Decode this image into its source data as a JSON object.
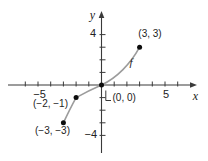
{
  "chart_data": {
    "type": "line",
    "title": "",
    "xlabel": "x",
    "ylabel": "y",
    "curve_label": "f",
    "grid": false,
    "xlim": [
      -7.4,
      7.5
    ],
    "ylim": [
      -5.4,
      5.8
    ],
    "points": [
      {
        "x": 3,
        "y": 3,
        "label": "(3, 3)"
      },
      {
        "x": 0,
        "y": 0,
        "label": "(0, 0)"
      },
      {
        "x": -2,
        "y": -1,
        "label": "(−2, −1)"
      },
      {
        "x": -3,
        "y": -3,
        "label": "(−3, −3)"
      }
    ],
    "x_axis": {
      "ticks_from": -6,
      "ticks_to": 6,
      "labeled_values": [
        -5,
        5
      ],
      "labeled_ticks": [
        "−5",
        "5"
      ]
    },
    "y_axis": {
      "ticks_from": -4,
      "ticks_to": 4,
      "labeled_values": [
        4,
        -4
      ],
      "labeled_ticks": [
        "4",
        "−4"
      ]
    },
    "curve_segments": {
      "start": [
        -3,
        -3
      ],
      "cubics": [
        [
          -2.65,
          -2.25,
          -2.3,
          -1.55,
          -2,
          -1
        ],
        [
          -1.2,
          -0.55,
          -0.5,
          -0.22,
          0,
          0
        ],
        [
          1.2,
          0.55,
          2.3,
          1.7,
          3,
          3
        ]
      ]
    }
  },
  "render": {
    "width": 208,
    "height": 161,
    "background": "#ffffff",
    "axis_color": "#3a3a3a",
    "text_color": "#222222",
    "curve_color": "#9c9c9c",
    "curve_width": 1.6,
    "f_label_color": "#b5b5b5",
    "point_color": "#0d0d0d",
    "point_radius": 2.5,
    "origin": {
      "x": 101.5,
      "y": 85
    },
    "unit": {
      "x": 12.7,
      "y": 12.6
    },
    "x_axis_px": {
      "x1": 8,
      "x2": 191,
      "arrow_tip": 197
    },
    "y_axis_px": {
      "y1": 153,
      "y2": 17,
      "arrow_tip": 11
    },
    "tick": {
      "x_up": 3.5,
      "x_down": 1.5,
      "y_right": 4,
      "y_left": 2
    },
    "origin_leader": [
      [
        105.8,
        90.5
      ],
      [
        105.8,
        100.5
      ],
      [
        111,
        100.5
      ]
    ],
    "labels": {
      "points": [
        {
          "text": "(3, 3)",
          "x": 150,
          "y": 36.5,
          "anchor": "middle",
          "size": 10
        },
        {
          "text": "(0, 0)",
          "x": 112.5,
          "y": 100.5,
          "anchor": "start",
          "size": 10
        },
        {
          "text": "(−2, −1)",
          "x": 50.5,
          "y": 106.5,
          "anchor": "middle",
          "size": 10
        },
        {
          "text": "(−3, −3)",
          "x": 52.5,
          "y": 134,
          "anchor": "middle",
          "size": 10
        }
      ],
      "axis_numbers": [
        {
          "text": "−5",
          "x": 39.5,
          "y": 98,
          "anchor": "middle",
          "size": 11,
          "axis": "x"
        },
        {
          "text": "5",
          "x": 166,
          "y": 98,
          "anchor": "middle",
          "size": 11,
          "axis": "x"
        },
        {
          "text": "4",
          "x": 96,
          "y": 37,
          "anchor": "end",
          "size": 11,
          "axis": "y"
        },
        {
          "text": "−4",
          "x": 97,
          "y": 137.5,
          "anchor": "end",
          "size": 11,
          "axis": "y"
        }
      ],
      "vars": [
        {
          "text": "y",
          "x": 92.5,
          "y": 19,
          "anchor": "middle",
          "size": 12,
          "role": "y-axis-label"
        },
        {
          "text": "x",
          "x": 195.5,
          "y": 100,
          "anchor": "middle",
          "size": 12,
          "role": "x-axis-label"
        },
        {
          "text": "f",
          "x": 131,
          "y": 66,
          "anchor": "middle",
          "size": 11,
          "role": "curve-f-label"
        }
      ]
    }
  }
}
